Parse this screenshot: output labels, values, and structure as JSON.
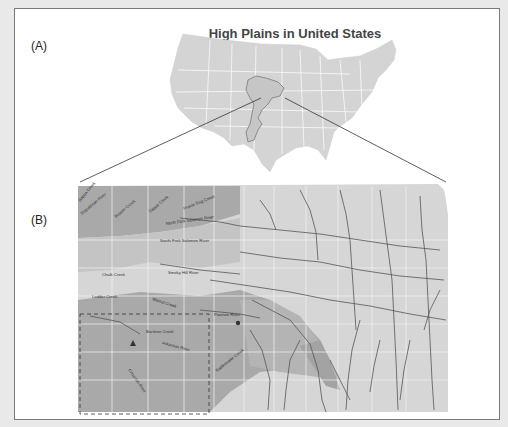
{
  "figure": {
    "panel_a": {
      "label": "(A)",
      "title": "High Plains in United States"
    },
    "panel_b": {
      "label": "(B)",
      "title": "Kansas",
      "river_labels": [
        "Sappa Creek",
        "Republican River",
        "Beaver Creek",
        "Sappa Creek",
        "Prairie Dog Creek",
        "North Fork Solomon River",
        "South Fork Solomon River",
        "Chalk Creek",
        "Smoky Hill River",
        "Ladder Creek",
        "Walnut Creek",
        "Pawnee River",
        "Buckner Creek",
        "Arkansas River",
        "Rattlesnake Creek",
        "Cimarron River"
      ],
      "markers": [
        {
          "shape": "triangle",
          "name": "site-triangle"
        },
        {
          "shape": "circle",
          "name": "site-circle"
        }
      ]
    },
    "colors": {
      "background": "#e9e9e9",
      "frame_border": "#7a7a7a",
      "us_map_fill": "#d4d4d4",
      "state_borders": "#ffffff",
      "high_plains_outline": "#7a7a7a",
      "aquifer_dark": "#a9a9a9",
      "aquifer_mid": "#bdbdbd",
      "kansas_light": "#d6d6d6",
      "rivers": "#555555",
      "county_lines": "#f4f4f4"
    }
  }
}
